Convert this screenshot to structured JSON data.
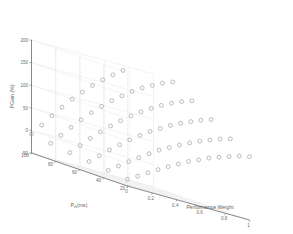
{
  "chart_data": {
    "type": "scatter",
    "projection": "3d",
    "title": "",
    "xlabel": "Performance Weight",
    "ylabel": "P_th (ms)",
    "zlabel": "PGain (%)",
    "x_label_main": "Performance Weight",
    "y_label_main": "P",
    "y_label_sub": "th",
    "y_label_unit": " (ms)",
    "z_label_main": "PGain (%)",
    "xticks": [
      "0",
      "0.2",
      "0.4",
      "0.6",
      "0.8",
      "1"
    ],
    "xtick_values": [
      0,
      0.2,
      0.4,
      0.6,
      0.8,
      1
    ],
    "yticks": [
      "100",
      "80",
      "60",
      "40",
      "20"
    ],
    "ytick_values": [
      100,
      80,
      60,
      40,
      20
    ],
    "zticks": [
      "-50",
      "0",
      "50",
      "100",
      "150",
      "200"
    ],
    "ztick_values": [
      -50,
      0,
      50,
      100,
      150,
      200
    ],
    "xlim": [
      0,
      1
    ],
    "ylim": [
      20,
      100
    ],
    "zlim": [
      -50,
      200
    ],
    "grid": true,
    "legend": null,
    "marker": "open-circle",
    "marker_color": "#9a9a9a",
    "grid_color": "#e2e2e2",
    "axis_color": "#6e6e6e",
    "background": "#ffffff",
    "x": [
      0,
      0.0833,
      0.1667,
      0.25,
      0.3333,
      0.4167,
      0.5,
      0.5833,
      0.6667,
      0.75,
      0.8333,
      0.9167,
      1
    ],
    "series": [
      {
        "name": "P_th = 20 ms",
        "y": 20,
        "values": [
          -35,
          -22,
          -8,
          5,
          18,
          30,
          42,
          52,
          62,
          70,
          78,
          85,
          90
        ]
      },
      {
        "name": "P_th = 36 ms",
        "y": 36,
        "values": [
          -30,
          -14,
          2,
          17,
          32,
          46,
          58,
          70,
          81,
          91,
          100,
          108,
          115
        ]
      },
      {
        "name": "P_th = 52 ms",
        "y": 52,
        "values": [
          -25,
          -6,
          13,
          31,
          48,
          64,
          79,
          92,
          105,
          116,
          126,
          135,
          143
        ]
      },
      {
        "name": "P_th = 68 ms",
        "y": 68,
        "values": [
          -20,
          2,
          24,
          45,
          64,
          82,
          99,
          114,
          128,
          141,
          152,
          162,
          170
        ]
      },
      {
        "name": "P_th = 84 ms",
        "y": 84,
        "values": [
          -14,
          10,
          34,
          57,
          79,
          99,
          118,
          135,
          151,
          165,
          177,
          188,
          197
        ]
      },
      {
        "name": "P_th = 100 ms",
        "y": 100,
        "values": [
          -8,
          18,
          45,
          70,
          94,
          116,
          137,
          156,
          173,
          189,
          203,
          215,
          225
        ]
      }
    ]
  },
  "axes": {
    "z_title": "PGain (%)",
    "y_title_base": "P",
    "y_title_sub": "th",
    "y_title_unit": "(ms)",
    "x_title": "Performance Weight"
  }
}
